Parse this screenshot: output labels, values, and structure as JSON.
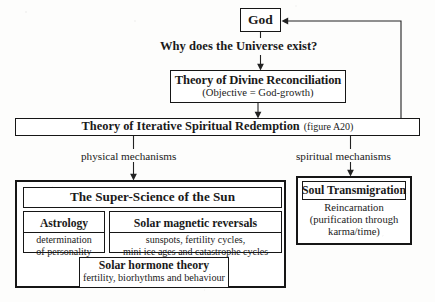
{
  "diagram": {
    "nodes": {
      "god": {
        "label": "God"
      },
      "question": {
        "label": "Why does the Universe exist?"
      },
      "divine": {
        "title": "Theory of Divine Reconciliation",
        "subtitle": "(Objective = God-growth)"
      },
      "iterative": {
        "title": "Theory of Iterative Spiritual Redemption",
        "reference": "(figure A20)"
      },
      "super_science": {
        "title": "The Super-Science of the Sun",
        "children": {
          "astrology": {
            "title": "Astrology",
            "line1": "determination",
            "line2": "of personality"
          },
          "magnetic": {
            "title": "Solar magnetic reversals",
            "line1": "sunspots, fertility cycles,",
            "line2": "mini ice ages and catastrophe cycles"
          },
          "hormone": {
            "title": "Solar hormone theory",
            "line1": "fertility, biorhythms and behaviour"
          }
        }
      },
      "soul": {
        "title": "Soul Transmigration",
        "line1": "Reincarnation",
        "line2": "(purification through",
        "line3": "karma/time)"
      }
    },
    "edge_labels": {
      "physical": "physical mechanisms",
      "spiritual": "spiritual mechanisms"
    },
    "colors": {
      "ink": "#161616",
      "paper": "#fdfdfc",
      "wire": "#222222"
    }
  }
}
